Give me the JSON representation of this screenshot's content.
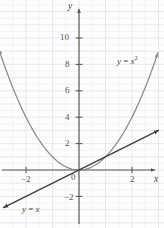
{
  "figure": {
    "background_color": "#fdfdfd",
    "grid_color": "#e3e3e6",
    "grid_color_minor": "#f0f0f2",
    "axis_color": "#555555",
    "parabola_color": "#8a8a8a",
    "line_color": "#3d3d3d"
  },
  "axes": {
    "x_axis_label": "x",
    "y_axis_label": "y",
    "origin_label": "0",
    "xlim": [
      -3.1,
      3.2
    ],
    "ylim": [
      -3.1,
      13.5
    ],
    "x_ticks": [
      -2,
      2
    ],
    "x_tick_labels": [
      "−2",
      "2"
    ],
    "y_ticks": [
      -2,
      2,
      4,
      6,
      8,
      10
    ],
    "y_tick_labels": [
      "−2",
      "2",
      "4",
      "6",
      "8",
      "10"
    ],
    "grid": true,
    "grid_spacing_units": 0.5
  },
  "curves": {
    "parabola": {
      "label_y": "y",
      "label_eq": "=",
      "label_var": "x",
      "label_exp": "2",
      "expression": "y = x²",
      "type": "quadratic",
      "color": "#8a8a8a",
      "arrow_both_ends": true,
      "points": [
        {
          "x": -3.05,
          "y": 9.3
        },
        {
          "x": -2.5,
          "y": 6.25
        },
        {
          "x": -2.0,
          "y": 4.0
        },
        {
          "x": -1.5,
          "y": 2.25
        },
        {
          "x": -1.0,
          "y": 1.0
        },
        {
          "x": -0.5,
          "y": 0.25
        },
        {
          "x": 0.0,
          "y": 0.0
        },
        {
          "x": 0.5,
          "y": 0.25
        },
        {
          "x": 1.0,
          "y": 1.0
        },
        {
          "x": 1.5,
          "y": 2.25
        },
        {
          "x": 2.0,
          "y": 4.0
        },
        {
          "x": 2.5,
          "y": 6.25
        },
        {
          "x": 3.05,
          "y": 9.3
        }
      ]
    },
    "line": {
      "label_y": "y",
      "label_eq": "=",
      "label_var": "x",
      "expression": "y = x",
      "type": "linear",
      "slope": 1,
      "intercept": 0,
      "color": "#3d3d3d",
      "arrow_both_ends": true,
      "points": [
        {
          "x": -2.85,
          "y": -2.85
        },
        {
          "x": 3.0,
          "y": 3.0
        }
      ]
    }
  },
  "chart_data": {
    "type": "line",
    "title": "",
    "xlabel": "x",
    "ylabel": "y",
    "xlim": [
      -3.1,
      3.2
    ],
    "ylim": [
      -3.1,
      13.5
    ],
    "grid": true,
    "legend": "inline-annotations",
    "x": [
      -3,
      -2.5,
      -2,
      -1.5,
      -1,
      -0.5,
      0,
      0.5,
      1,
      1.5,
      2,
      2.5,
      3
    ],
    "series": [
      {
        "name": "y = x²",
        "values": [
          9,
          6.25,
          4,
          2.25,
          1,
          0.25,
          0,
          0.25,
          1,
          2.25,
          4,
          6.25,
          9
        ],
        "color": "#8a8a8a"
      },
      {
        "name": "y = x",
        "values": [
          -3,
          -2.5,
          -2,
          -1.5,
          -1,
          -0.5,
          0,
          0.5,
          1,
          1.5,
          2,
          2.5,
          3
        ],
        "color": "#3d3d3d"
      }
    ],
    "annotations": [
      {
        "text": "y = x²",
        "x": 2.05,
        "y": 8.3
      },
      {
        "text": "y = x",
        "x": -2.1,
        "y": -2.9
      }
    ]
  }
}
